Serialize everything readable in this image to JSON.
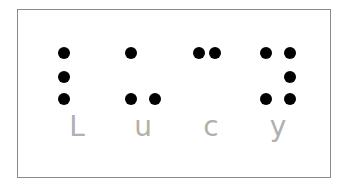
{
  "diagram": {
    "word": "Lucy",
    "colors": {
      "dot": "#000000",
      "letter": "#b0b0b0",
      "border": "#8a8a8a",
      "background": "#ffffff"
    },
    "cells": [
      {
        "letter": "L",
        "raised_dots": [
          1,
          2,
          3
        ]
      },
      {
        "letter": "u",
        "raised_dots": [
          1,
          3,
          6
        ]
      },
      {
        "letter": "c",
        "raised_dots": [
          1,
          4
        ]
      },
      {
        "letter": "y",
        "raised_dots": [
          1,
          3,
          4,
          5,
          6
        ]
      }
    ]
  }
}
